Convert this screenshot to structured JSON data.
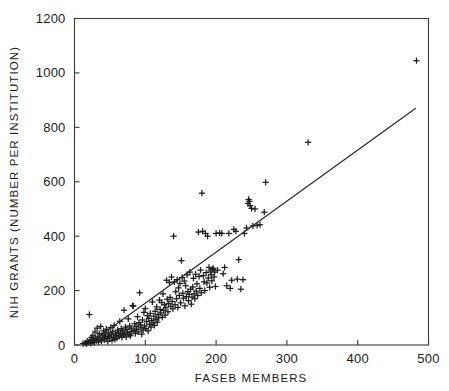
{
  "figure": {
    "background_color": "#ffffff",
    "ink_color": "#1c1c1c",
    "marker_symbol": "plus",
    "width": 449,
    "height": 391
  },
  "chart_data": {
    "type": "scatter",
    "title": "",
    "subtitle": "",
    "xlabel": "FASEB MEMBERS",
    "ylabel": "NIH GRANTS (NUMBER PER INSTITUTION)",
    "xlim": [
      0,
      500
    ],
    "ylim": [
      0,
      1200
    ],
    "xticks": [
      0,
      100,
      200,
      300,
      400,
      500
    ],
    "yticks": [
      0,
      200,
      400,
      600,
      800,
      1000,
      1200
    ],
    "xtick_labels": [
      "0",
      "100",
      "200",
      "300",
      "400",
      "500"
    ],
    "ytick_labels": [
      "0",
      "200",
      "400",
      "600",
      "800",
      "1000",
      "1200"
    ],
    "grid": false,
    "legend": null,
    "legend_position": "none",
    "annotations": [],
    "series": [
      {
        "name": "Institutions",
        "type": "scatter",
        "marker": "plus",
        "points": [
          [
            12,
            5
          ],
          [
            15,
            8
          ],
          [
            17,
            4
          ],
          [
            18,
            14
          ],
          [
            20,
            10
          ],
          [
            21,
            112
          ],
          [
            22,
            18
          ],
          [
            23,
            6
          ],
          [
            24,
            28
          ],
          [
            25,
            12
          ],
          [
            26,
            34
          ],
          [
            27,
            20
          ],
          [
            28,
            9
          ],
          [
            29,
            48
          ],
          [
            30,
            24
          ],
          [
            31,
            16
          ],
          [
            32,
            62
          ],
          [
            33,
            30
          ],
          [
            34,
            11
          ],
          [
            35,
            42
          ],
          [
            36,
            22
          ],
          [
            37,
            68
          ],
          [
            38,
            15
          ],
          [
            39,
            36
          ],
          [
            40,
            26
          ],
          [
            41,
            52
          ],
          [
            42,
            19
          ],
          [
            43,
            40
          ],
          [
            44,
            31
          ],
          [
            45,
            58
          ],
          [
            46,
            23
          ],
          [
            47,
            13
          ],
          [
            48,
            45
          ],
          [
            49,
            33
          ],
          [
            50,
            27
          ],
          [
            51,
            64
          ],
          [
            52,
            38
          ],
          [
            53,
            17
          ],
          [
            54,
            50
          ],
          [
            55,
            29
          ],
          [
            56,
            72
          ],
          [
            57,
            21
          ],
          [
            58,
            43
          ],
          [
            59,
            35
          ],
          [
            60,
            25
          ],
          [
            61,
            55
          ],
          [
            62,
            47
          ],
          [
            63,
            32
          ],
          [
            64,
            87
          ],
          [
            65,
            41
          ],
          [
            66,
            60
          ],
          [
            67,
            28
          ],
          [
            68,
            52
          ],
          [
            69,
            37
          ],
          [
            70,
            128
          ],
          [
            71,
            44
          ],
          [
            72,
            66
          ],
          [
            73,
            30
          ],
          [
            74,
            57
          ],
          [
            75,
            46
          ],
          [
            76,
            96
          ],
          [
            77,
            39
          ],
          [
            78,
            70
          ],
          [
            79,
            34
          ],
          [
            80,
            62
          ],
          [
            81,
            50
          ],
          [
            82,
            145
          ],
          [
            83,
            143
          ],
          [
            84,
            54
          ],
          [
            85,
            78
          ],
          [
            86,
            42
          ],
          [
            87,
            68
          ],
          [
            88,
            58
          ],
          [
            89,
            104
          ],
          [
            90,
            48
          ],
          [
            91,
            82
          ],
          [
            92,
            192
          ],
          [
            93,
            74
          ],
          [
            94,
            63
          ],
          [
            95,
            40
          ],
          [
            96,
            92
          ],
          [
            97,
            55
          ],
          [
            98,
            120
          ],
          [
            99,
            70
          ],
          [
            100,
            134
          ],
          [
            101,
            60
          ],
          [
            102,
            86
          ],
          [
            103,
            108
          ],
          [
            104,
            52
          ],
          [
            105,
            98
          ],
          [
            106,
            76
          ],
          [
            107,
            116
          ],
          [
            108,
            66
          ],
          [
            109,
            90
          ],
          [
            110,
            158
          ],
          [
            111,
            81
          ],
          [
            112,
            106
          ],
          [
            113,
            72
          ],
          [
            114,
            124
          ],
          [
            115,
            95
          ],
          [
            116,
            140
          ],
          [
            117,
            84
          ],
          [
            118,
            112
          ],
          [
            119,
            100
          ],
          [
            120,
            165
          ],
          [
            121,
            131
          ],
          [
            122,
            118
          ],
          [
            123,
            156
          ],
          [
            124,
            102
          ],
          [
            125,
            188
          ],
          [
            126,
            127
          ],
          [
            127,
            148
          ],
          [
            128,
            110
          ],
          [
            129,
            137
          ],
          [
            130,
            238
          ],
          [
            131,
            168
          ],
          [
            132,
            122
          ],
          [
            133,
            152
          ],
          [
            134,
            230
          ],
          [
            135,
            175
          ],
          [
            136,
            142
          ],
          [
            137,
            250
          ],
          [
            138,
            160
          ],
          [
            139,
            133
          ],
          [
            140,
            400
          ],
          [
            141,
            232
          ],
          [
            142,
            148
          ],
          [
            143,
            196
          ],
          [
            144,
            170
          ],
          [
            145,
            240
          ],
          [
            146,
            138
          ],
          [
            147,
            210
          ],
          [
            148,
            182
          ],
          [
            149,
            226
          ],
          [
            150,
            155
          ],
          [
            151,
            310
          ],
          [
            152,
            248
          ],
          [
            153,
            190
          ],
          [
            154,
            172
          ],
          [
            155,
            235
          ],
          [
            156,
            144
          ],
          [
            157,
            218
          ],
          [
            158,
            178
          ],
          [
            159,
            258
          ],
          [
            160,
            196
          ],
          [
            161,
            163
          ],
          [
            162,
            186
          ],
          [
            163,
            268
          ],
          [
            164,
            205
          ],
          [
            165,
            150
          ],
          [
            166,
            176
          ],
          [
            167,
            213
          ],
          [
            168,
            245
          ],
          [
            169,
            188
          ],
          [
            170,
            170
          ],
          [
            171,
            260
          ],
          [
            172,
            198
          ],
          [
            173,
            225
          ],
          [
            174,
            182
          ],
          [
            175,
            415
          ],
          [
            176,
            252
          ],
          [
            177,
            208
          ],
          [
            178,
            275
          ],
          [
            179,
            192
          ],
          [
            180,
            558
          ],
          [
            181,
            418
          ],
          [
            182,
            255
          ],
          [
            183,
            232
          ],
          [
            184,
            200
          ],
          [
            185,
            410
          ],
          [
            186,
            266
          ],
          [
            187,
            228
          ],
          [
            188,
            400
          ],
          [
            189,
            246
          ],
          [
            190,
            285
          ],
          [
            191,
            212
          ],
          [
            192,
            272
          ],
          [
            193,
            258
          ],
          [
            194,
            236
          ],
          [
            195,
            278
          ],
          [
            196,
            282
          ],
          [
            197,
            250
          ],
          [
            198,
            268
          ],
          [
            199,
            215
          ],
          [
            200,
            410
          ],
          [
            202,
            275
          ],
          [
            205,
            412
          ],
          [
            208,
            410
          ],
          [
            210,
            262
          ],
          [
            212,
            285
          ],
          [
            215,
            218
          ],
          [
            218,
            410
          ],
          [
            220,
            208
          ],
          [
            222,
            238
          ],
          [
            225,
            425
          ],
          [
            228,
            418
          ],
          [
            230,
            242
          ],
          [
            232,
            314
          ],
          [
            235,
            205
          ],
          [
            238,
            240
          ],
          [
            240,
            410
          ],
          [
            243,
            430
          ],
          [
            245,
            520
          ],
          [
            246,
            535
          ],
          [
            247,
            528
          ],
          [
            248,
            512
          ],
          [
            250,
            502
          ],
          [
            252,
            438
          ],
          [
            255,
            500
          ],
          [
            258,
            440
          ],
          [
            262,
            442
          ],
          [
            268,
            488
          ],
          [
            270,
            598
          ],
          [
            330,
            745
          ],
          [
            483,
            1045
          ]
        ]
      },
      {
        "name": "Regression line",
        "type": "line",
        "endpoints": [
          [
            18,
            0
          ],
          [
            482,
            870
          ]
        ],
        "slope": 1.875,
        "intercept": -33.8
      }
    ],
    "n_points": 213
  },
  "axes": {
    "x_title": "FASEB MEMBERS",
    "y_title": "NIH GRANTS (NUMBER PER INSTITUTION)",
    "frame": "box"
  }
}
